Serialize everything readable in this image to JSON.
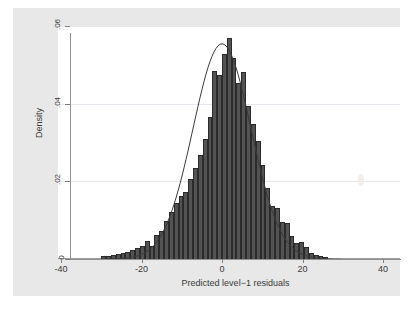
{
  "chart_data": {
    "type": "bar",
    "title": "",
    "subtitle": "",
    "xlabel": "Predicted level−1 residuals",
    "ylabel": "Density",
    "xlim": [
      -40,
      40
    ],
    "ylim": [
      0,
      0.06
    ],
    "xticks": [
      -40,
      -20,
      0,
      20,
      40
    ],
    "xtick_labels": [
      "-40",
      "-20",
      "0",
      "20",
      "40"
    ],
    "yticks": [
      0,
      0.02,
      0.04,
      0.06
    ],
    "ytick_labels": [
      "0",
      ".02",
      ".04",
      ".06"
    ],
    "grid": "horizontal",
    "legend": "none",
    "bin_width": 1.2,
    "bar_color": "#535353",
    "bar_edge_color": "#2b2b2b",
    "curve_color": "#3a3a3a",
    "background_color": "#e8e8e8",
    "plot_background_color": "#ffffff",
    "categories": [
      -29.4,
      -28.2,
      -27.0,
      -25.8,
      -24.6,
      -23.4,
      -22.2,
      -21.0,
      -19.8,
      -18.6,
      -17.4,
      -16.2,
      -15.0,
      -13.8,
      -12.6,
      -11.4,
      -10.2,
      -9.0,
      -7.8,
      -6.6,
      -5.4,
      -4.2,
      -3.0,
      -1.8,
      -0.6,
      0.6,
      1.8,
      3.0,
      4.2,
      5.4,
      6.6,
      7.8,
      9.0,
      10.2,
      11.4,
      12.6,
      13.8,
      15.0,
      16.2,
      17.4,
      18.6,
      19.8,
      21.0,
      22.2,
      23.4,
      24.6,
      25.8
    ],
    "values": [
      0.0008,
      0.0009,
      0.0011,
      0.0013,
      0.0016,
      0.0019,
      0.0022,
      0.0029,
      0.0034,
      0.0046,
      0.0034,
      0.0062,
      0.0072,
      0.0098,
      0.0121,
      0.0143,
      0.0162,
      0.0173,
      0.0206,
      0.0235,
      0.0268,
      0.0309,
      0.0365,
      0.0483,
      0.0474,
      0.0528,
      0.0568,
      0.0518,
      0.0452,
      0.0482,
      0.0395,
      0.0347,
      0.0304,
      0.0243,
      0.0182,
      0.0136,
      0.0132,
      0.0095,
      0.0094,
      0.0058,
      0.004,
      0.0044,
      0.0032,
      0.0015,
      0.0011,
      0.0008,
      0.0006
    ],
    "overlay": {
      "type": "normal-density-curve",
      "mean": 0.0,
      "sd": 7.2,
      "peak": 0.0554
    },
    "series": [
      {
        "name": "Density",
        "values": [
          0.0008,
          0.0009,
          0.0011,
          0.0013,
          0.0016,
          0.0019,
          0.0022,
          0.0029,
          0.0034,
          0.0046,
          0.0034,
          0.0062,
          0.0072,
          0.0098,
          0.0121,
          0.0143,
          0.0162,
          0.0173,
          0.0206,
          0.0235,
          0.0268,
          0.0309,
          0.0365,
          0.0483,
          0.0474,
          0.0528,
          0.0568,
          0.0518,
          0.0452,
          0.0482,
          0.0395,
          0.0347,
          0.0304,
          0.0243,
          0.0182,
          0.0136,
          0.0132,
          0.0095,
          0.0094,
          0.0058,
          0.004,
          0.0044,
          0.0032,
          0.0015,
          0.0011,
          0.0008,
          0.0006
        ]
      }
    ]
  }
}
